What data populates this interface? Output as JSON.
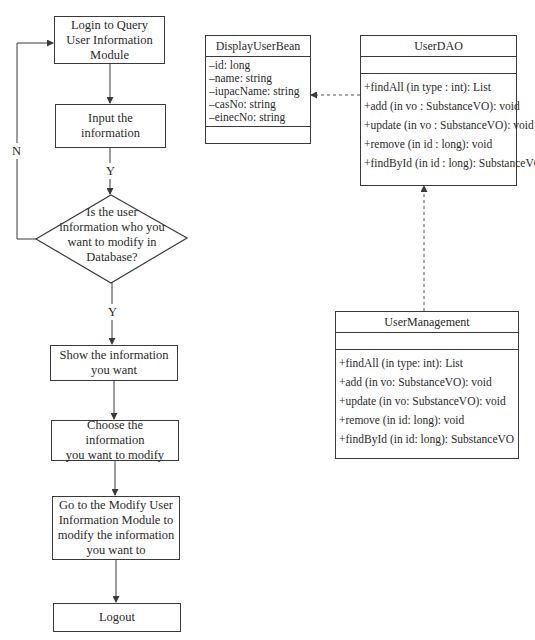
{
  "flowchart": {
    "steps": [
      {
        "id": "login",
        "lines": [
          "Login to Query",
          "User Information",
          "Module"
        ]
      },
      {
        "id": "input",
        "lines": [
          "Input the",
          "information"
        ]
      },
      {
        "id": "decision",
        "lines": [
          "Is the user",
          "information who you",
          "want to modify in",
          "Database?"
        ]
      },
      {
        "id": "show",
        "lines": [
          "Show the information",
          "you want"
        ]
      },
      {
        "id": "choose",
        "lines": [
          "Choose the information",
          "you want to modify"
        ]
      },
      {
        "id": "modify",
        "lines": [
          "Go to the Modify User",
          "Information Module to",
          "modify the information",
          "you want to"
        ]
      },
      {
        "id": "logout",
        "lines": [
          "Logout"
        ]
      }
    ],
    "labels": {
      "no_loop": "N",
      "yes_after_input": "Y",
      "yes_after_decision": "Y"
    }
  },
  "uml": {
    "display_user_bean": {
      "name": "DisplayUserBean",
      "attributes": [
        "–id: long",
        "–name: string",
        "–iupacName: string",
        "–casNo: string",
        "–einecNo: string"
      ],
      "operations": []
    },
    "user_dao": {
      "name": "UserDAO",
      "attributes": [],
      "operations": [
        "+findAll (in type : int): List",
        "+add (in vo : SubstanceVO): void",
        "+update (in vo : SubstanceVO): void",
        "+remove (in id : long): void",
        "+findById (in id : long): SubstanceVO"
      ]
    },
    "user_management": {
      "name": "UserManagement",
      "attributes": [],
      "operations": [
        "+findAll (in type: int): List",
        "+add (in vo: SubstanceVO): void",
        "+update (in vo: SubstanceVO): void",
        "+remove (in id: long): void",
        "+findById (in id: long): SubstanceVO"
      ]
    }
  },
  "colors": {
    "line": "#3a3a3a",
    "background": "#ffffff",
    "text": "#2a2a2a"
  }
}
